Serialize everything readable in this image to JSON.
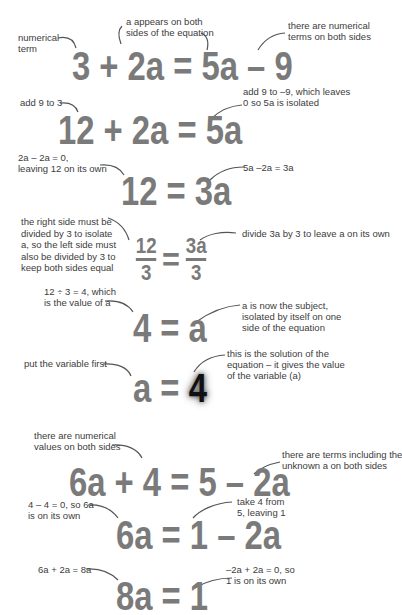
{
  "example1": {
    "equations": [
      {
        "id": "eq1",
        "text": "3 + 2a = 5a – 9"
      },
      {
        "id": "eq2",
        "text": "12 + 2a = 5a"
      },
      {
        "id": "eq3",
        "text": "12 = 3a"
      },
      {
        "id": "eq4",
        "numer_left": "12",
        "denom_left": "3",
        "equals": "=",
        "numer_right": "3a",
        "denom_right": "3"
      },
      {
        "id": "eq5",
        "text": "4 = a"
      },
      {
        "id": "eq6",
        "left": "a = ",
        "right": "4"
      }
    ],
    "notes": {
      "numerical_term": [
        "numerical",
        "term"
      ],
      "a_both_sides": [
        "a appears on both",
        "sides of the equation"
      ],
      "numerical_both_sides": [
        "there are numerical",
        "terms on both sides"
      ],
      "add_9_to_3": [
        "add 9 to 3"
      ],
      "add_9_to_minus9": [
        "add 9 to –9, which leaves",
        "0 so 5a is isolated"
      ],
      "two_a_minus": [
        "2a – 2a = 0,",
        "leaving 12 on its own"
      ],
      "five_a_minus": [
        "5a –2a = 3a"
      ],
      "right_side_divided": [
        "the right side must be",
        "divided by 3 to isolate",
        "a, so the left side must",
        "also be divided by 3 to",
        "keep both sides equal"
      ],
      "divide_3a": [
        "divide 3a by 3 to leave a on its own"
      ],
      "twelve_div_3": [
        "12 ÷ 3 = 4, which",
        "is the value of a"
      ],
      "a_subject": [
        "a is now the subject,",
        "isolated by itself on one",
        "side of the equation"
      ],
      "variable_first": [
        "put the variable first"
      ],
      "solution": [
        "this is the solution of the",
        "equation – it gives the value",
        "of the variable (a)"
      ]
    }
  },
  "example2": {
    "equations": [
      {
        "id": "eq7",
        "text": "6a + 4 = 5 – 2a"
      },
      {
        "id": "eq8",
        "text": "6a = 1 – 2a"
      },
      {
        "id": "eq9",
        "text": "8a = 1"
      }
    ],
    "notes": {
      "numerical_values": [
        "there are numerical",
        "values on both sides"
      ],
      "terms_unknown": [
        "there are terms including the",
        "unknown a on both sides"
      ],
      "four_minus_four": [
        "4 – 4 = 0, so 6a",
        "is on its own"
      ],
      "take_4": [
        "take 4 from",
        "5, leaving 1"
      ],
      "six_plus_two": [
        "6a + 2a = 8a"
      ],
      "minus2a": [
        "–2a + 2a = 0, so",
        "1 is on its own"
      ]
    }
  },
  "colors": {
    "equation": "#7a7a7a",
    "note": "#3c3c3c",
    "highlight": "#111111"
  }
}
